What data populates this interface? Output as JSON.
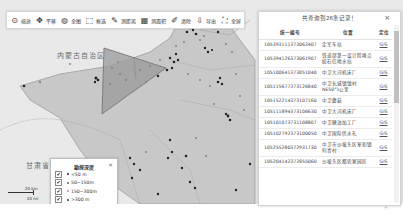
{
  "toolbar": {
    "items": [
      {
        "icon": "zoom-icon",
        "glyph": "⊙",
        "label": "缩放"
      },
      {
        "icon": "pan-icon",
        "glyph": "✥",
        "label": "平移"
      },
      {
        "icon": "globe-icon",
        "glyph": "◍",
        "label": "全图"
      },
      {
        "icon": "box-select-icon",
        "glyph": "⬚",
        "label": "框选"
      },
      {
        "icon": "ruler-icon",
        "glyph": "✎",
        "label": "测距离"
      },
      {
        "icon": "area-icon",
        "glyph": "▦",
        "label": "测面积"
      },
      {
        "icon": "eraser-icon",
        "glyph": "✐",
        "label": "清除"
      },
      {
        "icon": "export-icon",
        "glyph": "⇩",
        "label": "导出"
      },
      {
        "icon": "fullscreen-icon",
        "glyph": "⛶",
        "label": "全屏"
      }
    ]
  },
  "map": {
    "labels": {
      "inner_mongolia": "内蒙古自治区",
      "gansu": "甘肃省"
    },
    "colors": {
      "background": "#e9e9e9",
      "region_fill": "#c8c8c8",
      "polygon_fill": "#9a9a9a",
      "polygon_stroke": "#7a7a7a",
      "point_dark": "#222222",
      "point_light": "#8a8a8a"
    }
  },
  "results_panel": {
    "title": "共查询到26条记录！",
    "close": "×",
    "columns": [
      "统一编号",
      "位置",
      "定位"
    ],
    "rows": [
      {
        "id": "105393111373062407",
        "location": "定军车站",
        "action": "GIS"
      },
      {
        "id": "105394126373061907",
        "location": "铁道部第一设计院堆点统石信地水站",
        "action": "GIS"
      },
      {
        "id": "105100641373051040",
        "location": "中卫大河机床厂",
        "action": "GIS"
      },
      {
        "id": "105115677373126840",
        "location": "中卫长城镇镇村NE50°1公里",
        "action": "GIS"
      },
      {
        "id": "105152214373107160",
        "location": "中卫蘑菇",
        "action": "GIS"
      },
      {
        "id": "105111894373106630",
        "location": "中卫大河机床厂",
        "action": "GIS"
      },
      {
        "id": "105101073731108807",
        "location": "中卫糖油加工厂",
        "action": "GIS"
      },
      {
        "id": "105102792373100050",
        "location": "中卫国际供水礼",
        "action": "GIS"
      },
      {
        "id": "105255280372931730",
        "location": "中卫市沙坡头区室和镇何青村",
        "action": "GIS"
      },
      {
        "id": "105204142372855060",
        "location": "沙坡头区都农家园区",
        "action": "GIS"
      }
    ]
  },
  "legend": {
    "title": "勘探深度",
    "close": "×",
    "items": [
      {
        "label": "<50 m",
        "color": "#222222",
        "checked": "✔"
      },
      {
        "label": "50~150m",
        "color": "#666666",
        "checked": "✔"
      },
      {
        "label": "150~300m",
        "color": "#999999",
        "checked": "✔"
      },
      {
        "label": ">300 m",
        "color": "#333333",
        "checked": "✔"
      }
    ]
  },
  "scale": {
    "top": "20 km",
    "bottom": "20 mi"
  }
}
